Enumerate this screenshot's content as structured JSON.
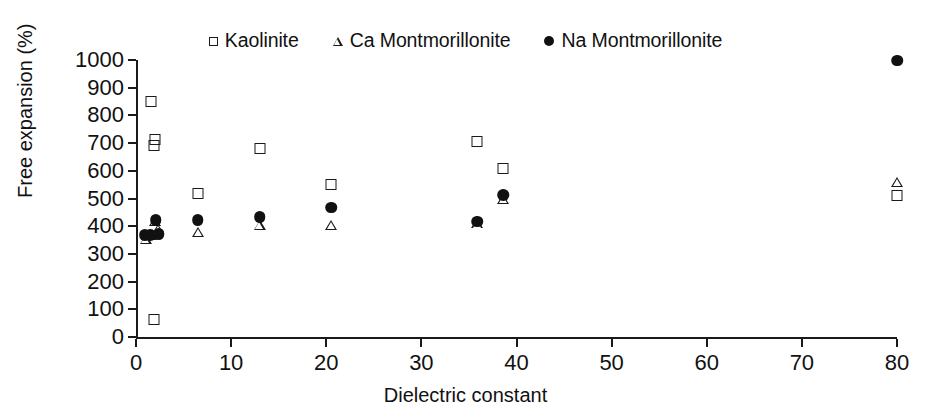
{
  "chart_data": {
    "type": "scatter",
    "title": "",
    "xlabel": "Dielectric constant",
    "ylabel": "Free expansion (%)",
    "xlim": [
      0,
      80
    ],
    "ylim": [
      0,
      1000
    ],
    "xticks": [
      0,
      10,
      20,
      30,
      40,
      50,
      60,
      70,
      80
    ],
    "yticks": [
      0,
      100,
      200,
      300,
      400,
      500,
      600,
      700,
      800,
      900,
      1000
    ],
    "grid": false,
    "legend_position": "top-center",
    "series": [
      {
        "name": "Kaolinite",
        "marker": "open-square",
        "color": "#1a1a1a",
        "points": [
          {
            "x": 1.9,
            "y": 60
          },
          {
            "x": 1.9,
            "y": 690
          },
          {
            "x": 2.0,
            "y": 710
          },
          {
            "x": 1.6,
            "y": 850
          },
          {
            "x": 6.5,
            "y": 515
          },
          {
            "x": 13.0,
            "y": 680
          },
          {
            "x": 20.5,
            "y": 550
          },
          {
            "x": 35.9,
            "y": 705
          },
          {
            "x": 38.6,
            "y": 605
          },
          {
            "x": 80.0,
            "y": 510
          }
        ]
      },
      {
        "name": "Ca Montmorillonite",
        "marker": "open-triangle",
        "color": "#1a1a1a",
        "points": [
          {
            "x": 1.0,
            "y": 355
          },
          {
            "x": 1.6,
            "y": 370
          },
          {
            "x": 2.0,
            "y": 420
          },
          {
            "x": 2.3,
            "y": 390
          },
          {
            "x": 6.5,
            "y": 380
          },
          {
            "x": 13.0,
            "y": 405
          },
          {
            "x": 20.5,
            "y": 405
          },
          {
            "x": 35.9,
            "y": 410
          },
          {
            "x": 38.6,
            "y": 500
          },
          {
            "x": 80.0,
            "y": 560
          }
        ]
      },
      {
        "name": "Na Montmorillonite",
        "marker": "filled-circle",
        "color": "#111111",
        "points": [
          {
            "x": 0.9,
            "y": 365
          },
          {
            "x": 1.5,
            "y": 365
          },
          {
            "x": 2.1,
            "y": 420
          },
          {
            "x": 2.4,
            "y": 370
          },
          {
            "x": 6.5,
            "y": 420
          },
          {
            "x": 13.0,
            "y": 430
          },
          {
            "x": 20.5,
            "y": 465
          },
          {
            "x": 35.9,
            "y": 415
          },
          {
            "x": 38.6,
            "y": 510
          },
          {
            "x": 80.0,
            "y": 995
          }
        ]
      }
    ]
  },
  "legend": {
    "entries": [
      {
        "label": "Kaolinite",
        "marker": "open-square"
      },
      {
        "label": "Ca Montmorillonite",
        "marker": "open-triangle"
      },
      {
        "label": "Na Montmorillonite",
        "marker": "filled-circle"
      }
    ]
  },
  "axes": {
    "ylabel": "Free expansion (%)",
    "xlabel": "Dielectric constant",
    "yticklabels": [
      "1000",
      "900",
      "800",
      "700",
      "600",
      "500",
      "400",
      "300",
      "200",
      "100",
      "0"
    ],
    "xticklabels": [
      "0",
      "10",
      "20",
      "30",
      "40",
      "50",
      "60",
      "70",
      "80"
    ]
  }
}
